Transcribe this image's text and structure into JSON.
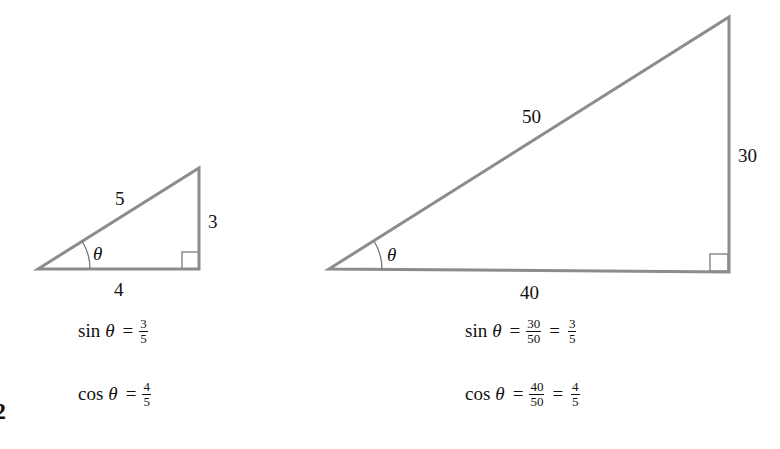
{
  "figure_number": "2",
  "small_triangle": {
    "hypotenuse": "5",
    "opposite": "3",
    "adjacent": "4",
    "angle": "θ",
    "sin": {
      "fn": "sin",
      "var": "θ",
      "eq": "=",
      "num": "3",
      "den": "5"
    },
    "cos": {
      "fn": "cos",
      "var": "θ",
      "eq": "=",
      "num": "4",
      "den": "5"
    }
  },
  "large_triangle": {
    "hypotenuse": "50",
    "opposite": "30",
    "adjacent": "40",
    "angle": "θ",
    "sin": {
      "fn": "sin",
      "var": "θ",
      "eq": "=",
      "num1": "30",
      "den1": "50",
      "eq2": "=",
      "num2": "3",
      "den2": "5"
    },
    "cos": {
      "fn": "cos",
      "var": "θ",
      "eq": "=",
      "num1": "40",
      "den1": "50",
      "eq2": "=",
      "num2": "4",
      "den2": "5"
    }
  },
  "colors": {
    "line": "#8c8c8c",
    "text": "#111111"
  }
}
